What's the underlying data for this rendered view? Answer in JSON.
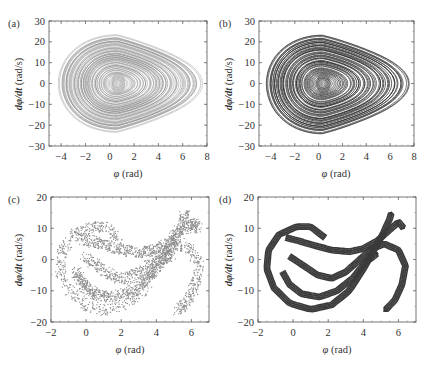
{
  "chart_data": [
    {
      "panel": "(a)",
      "type": "scatter",
      "title": "",
      "xlabel": "φ (rad)",
      "ylabel": "dφ/dt (rad/s)",
      "xlim": [
        -5,
        8
      ],
      "ylim": [
        -30,
        30
      ],
      "xticks": [
        -4,
        -2,
        0,
        2,
        4,
        6,
        8
      ],
      "yticks": [
        -30,
        -20,
        -10,
        0,
        10,
        20,
        30
      ],
      "grid": false,
      "legend": null,
      "style": "light gray dense trajectory",
      "color": "#8a8a8a",
      "description": "Phase-space trajectory: nested closed loops centered near (0.5, 0) extending from φ≈-3.8 to φ≈7, dφ/dt from ≈-25 to ≈25, with lobe toward φ≈4-6",
      "envelope": {
        "phi_min": -3.8,
        "phi_max": 7.0,
        "dphi_min": -25,
        "dphi_max": 25,
        "center_phi": 0.6
      }
    },
    {
      "panel": "(b)",
      "type": "scatter",
      "title": "",
      "xlabel": "φ (rad)",
      "ylabel": "dφ/dt (rad/s)",
      "xlim": [
        -5,
        8
      ],
      "ylim": [
        -30,
        30
      ],
      "xticks": [
        -4,
        -2,
        0,
        2,
        4,
        6,
        8
      ],
      "yticks": [
        -30,
        -20,
        -10,
        0,
        10,
        20,
        30
      ],
      "grid": false,
      "legend": null,
      "style": "dark dense trajectory",
      "color": "#2e2e2e",
      "description": "Phase-space trajectory: dark nested loops centered near (0.3, 0) extending from φ≈-4 to φ≈7, dφ/dt from ≈-26 to ≈25",
      "envelope": {
        "phi_min": -4.0,
        "phi_max": 7.0,
        "dphi_min": -26,
        "dphi_max": 25,
        "center_phi": 0.3
      }
    },
    {
      "panel": "(c)",
      "type": "scatter",
      "title": "",
      "xlabel": "φ (rad)",
      "ylabel": "dφ/dt (rad/s)",
      "xlim": [
        -2,
        7
      ],
      "ylim": [
        -20,
        20
      ],
      "xticks": [
        -2,
        0,
        2,
        4,
        6
      ],
      "yticks": [
        -20,
        -10,
        0,
        10,
        20
      ],
      "grid": false,
      "legend": null,
      "style": "gray point cloud (Poincaré section)",
      "color": "#8c8c8c",
      "description": "Strange attractor Poincaré section: S-shaped folded band from (-1.5,-5) through (0.5,10) down to (2,-8) and up to (5.5,15) then down to (5,-17)",
      "envelope": {
        "phi_min": -1.6,
        "phi_max": 6.6,
        "dphi_min": -17,
        "dphi_max": 16
      }
    },
    {
      "panel": "(d)",
      "type": "scatter",
      "title": "",
      "xlabel": "φ (rad)",
      "ylabel": "dφ/dt (rad/s)",
      "xlim": [
        -2,
        7
      ],
      "ylim": [
        -20,
        20
      ],
      "xticks": [
        -2,
        0,
        2,
        4,
        6
      ],
      "yticks": [
        -20,
        -10,
        0,
        10,
        20
      ],
      "grid": false,
      "legend": null,
      "style": "dark fine-structured fractal bands",
      "color": "#3a3a3a",
      "description": "Strange attractor Poincaré section with fine filamentary structure: S-shaped folded bands spanning φ≈-1.8 to 6.4, dφ/dt≈-18 to 16",
      "envelope": {
        "phi_min": -1.8,
        "phi_max": 6.4,
        "dphi_min": -18,
        "dphi_max": 16
      }
    }
  ],
  "panels": {
    "a": {
      "label": "(a)",
      "xlabel_sym": "φ",
      "xlabel_unit": " (rad)",
      "ylabel_sym": "dφ/dt",
      "ylabel_unit": " (rad/s)"
    },
    "b": {
      "label": "(b)",
      "xlabel_sym": "φ",
      "xlabel_unit": " (rad)",
      "ylabel_sym": "dφ/dt",
      "ylabel_unit": " (rad/s)"
    },
    "c": {
      "label": "(c)",
      "xlabel_sym": "φ",
      "xlabel_unit": " (rad)",
      "ylabel_sym": "dφ/dt",
      "ylabel_unit": " (rad/s)"
    },
    "d": {
      "label": "(d)",
      "xlabel_sym": "φ",
      "xlabel_unit": " (rad)",
      "ylabel_sym": "dφ/dt",
      "ylabel_unit": " (rad/s)"
    }
  },
  "tick_labels": {
    "ab_x": [
      "−4",
      "−2",
      "0",
      "2",
      "4",
      "6",
      "8"
    ],
    "ab_y": [
      "30",
      "20",
      "10",
      "0",
      "−10",
      "−20",
      "−30"
    ],
    "cd_x": [
      "−2",
      "0",
      "2",
      "4",
      "6"
    ],
    "cd_y": [
      "20",
      "10",
      "0",
      "−10",
      "−20"
    ]
  }
}
